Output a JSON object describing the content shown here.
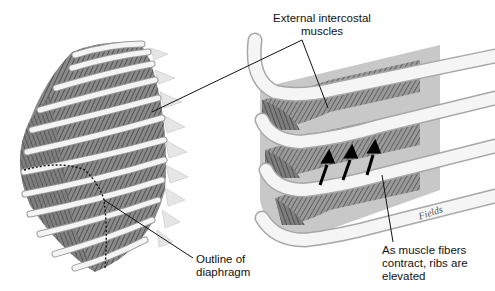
{
  "labels": {
    "external_intercostal": [
      "External intercostal",
      "muscles"
    ],
    "outline_diaphragm": [
      "Outline of",
      "diaphragm"
    ],
    "fibers_contract": [
      "As muscle fibers",
      "contract, ribs are",
      "elevated"
    ]
  },
  "signature": "Fields",
  "colors": {
    "rib": "#f2f2f2",
    "rib_edge": "#9a9a9a",
    "muscle_dark": "#5a5a5a",
    "muscle_mid": "#8a8a8a",
    "leader": "#111111"
  }
}
